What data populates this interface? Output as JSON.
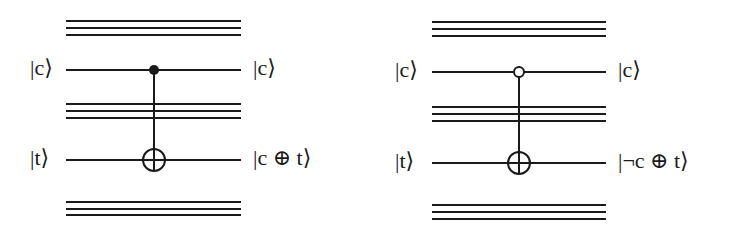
{
  "figure": {
    "panels": [
      {
        "name": "cnot-positive-control",
        "control_type": "filled",
        "input_labels": {
          "control": "|c⟩",
          "target": "|t⟩"
        },
        "output_labels": {
          "control": "|c⟩",
          "target": "|c ⊕ t⟩"
        },
        "geometry": {
          "x_start": 66,
          "x_end": 241,
          "gate_x": 154,
          "control_y": 70,
          "target_y": 160,
          "top_bus_y": [
            21,
            28,
            35
          ],
          "mid_bus_y": [
            104,
            111,
            118
          ],
          "bottom_bus_y": [
            202,
            209,
            215
          ],
          "input_label_x": 30,
          "output_label_x": 253
        }
      },
      {
        "name": "cnot-negative-control",
        "control_type": "open",
        "input_labels": {
          "control": "|c⟩",
          "target": "|t⟩"
        },
        "output_labels": {
          "control": "|c⟩",
          "target": "|¬c ⊕ t⟩"
        },
        "geometry": {
          "x_start": 432,
          "x_end": 606,
          "gate_x": 519,
          "control_y": 72,
          "target_y": 163,
          "top_bus_y": [
            22,
            29,
            36
          ],
          "mid_bus_y": [
            107,
            114,
            121
          ],
          "bottom_bus_y": [
            205,
            212,
            219
          ],
          "input_label_x": 395,
          "output_label_x": 618
        }
      }
    ],
    "colors": {
      "ink": "#1a1a1a",
      "background": "#ffffff"
    }
  }
}
